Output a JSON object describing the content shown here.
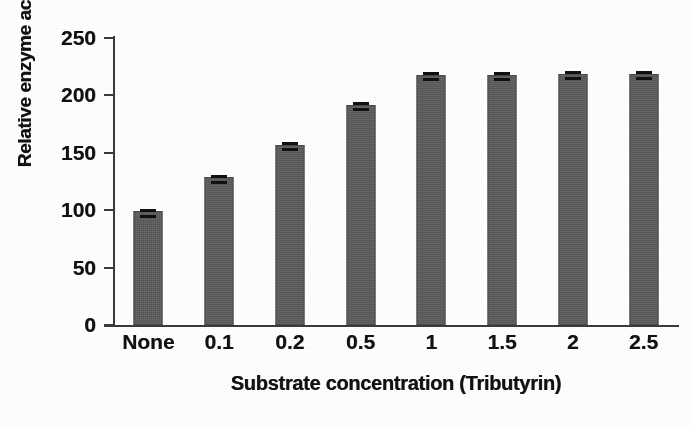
{
  "chart_data": {
    "type": "bar",
    "title": "",
    "subtitle": "",
    "xlabel": "Substrate concentration  (Tributyrin)",
    "ylabel": "Relative enzyme activity (%)",
    "categories": [
      "None",
      "0.1",
      "0.2",
      "0.5",
      "1",
      "1.5",
      "2",
      "2.5"
    ],
    "values": [
      99,
      129,
      157,
      192,
      218,
      218,
      219,
      219
    ],
    "errors": [
      2,
      2,
      2,
      2,
      2,
      2,
      2,
      2
    ],
    "ylim": [
      0,
      250
    ],
    "yticks": [
      0,
      50,
      100,
      150,
      200,
      250
    ],
    "ytick_labels": [
      "0",
      "50",
      "100",
      "150",
      "200",
      "250"
    ],
    "grid": false,
    "legend": false,
    "legend_position": "none",
    "series": [
      {
        "name": "Relative enzyme activity",
        "values": [
          99,
          129,
          157,
          192,
          218,
          218,
          219,
          219
        ]
      }
    ]
  },
  "style": {
    "bar_color": "#5b5b5b",
    "bar_edge_color": "#4a4a4a",
    "error_bar_color": "#101010",
    "axis_color": "#3a3a3a",
    "text_color": "#111111",
    "background": "#fdfdfc"
  }
}
